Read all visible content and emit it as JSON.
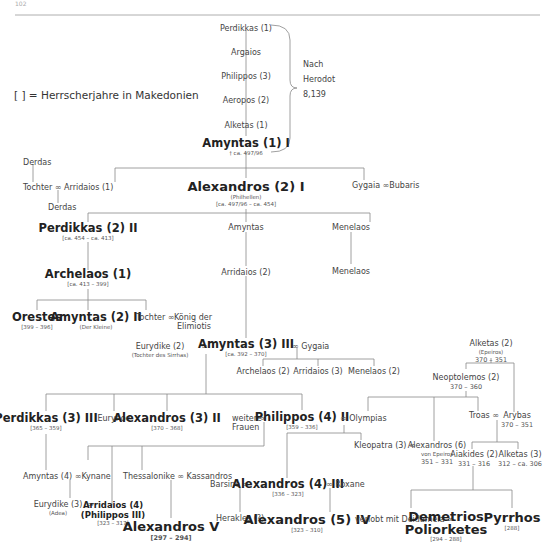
{
  "page_number": "102",
  "legend": "[ ] = Herrscherjahre in Makedonien",
  "marriage_symbol": "∞",
  "herodot": {
    "list": [
      "Perdikkas (1)",
      "Argaios",
      "Philippos (3)",
      "Aeropos (2)",
      "Alketas (1)"
    ],
    "note_lines": [
      "Nach",
      "Herodot",
      "8,139"
    ]
  },
  "nodes": {
    "amyntas1": {
      "name": "Amyntas (1) I",
      "sub": "† ca. 497/96"
    },
    "derdas_top": {
      "name": "Derdas"
    },
    "tochter1": {
      "name": "Tochter"
    },
    "arridaios1": {
      "name": "Arridaios (1)"
    },
    "derdas_bottom": {
      "name": "Derdas"
    },
    "alexandros2": {
      "name": "Alexandros (2) I",
      "note": "(Philhellen)",
      "years": "[ca. 497/96 – ca. 454]"
    },
    "gygaia1": {
      "name": "Gygaia"
    },
    "bubaris": {
      "name": "Bubaris"
    },
    "perdikkas2": {
      "name": "Perdikkas (2) II",
      "years": "[ca. 454 – ca. 413]"
    },
    "amyntas_mid": {
      "name": "Amyntas"
    },
    "menelaos1": {
      "name": "Menelaos"
    },
    "archelaos1": {
      "name": "Archelaos (1)",
      "years": "[ca. 413 – 399]"
    },
    "arridaios2": {
      "name": "Arridaios (2)"
    },
    "menelaos2": {
      "name": "Menelaos"
    },
    "orestes": {
      "name": "Orestes",
      "years": "[399 – 396]"
    },
    "amyntas2": {
      "name": "Amyntas (2) II",
      "note": "(Der Kleine)"
    },
    "tochter2": {
      "name": "Tochter"
    },
    "koenig_elimiotis": {
      "name_lines": [
        "König der",
        "Elimiotis"
      ]
    },
    "eurydike2": {
      "name": "Eurydike (2)",
      "note": "(Tochter des Sirrhas)"
    },
    "amyntas3": {
      "name": "Amyntas (3) III",
      "years": "[ca. 392 – 370]"
    },
    "gygaia2": {
      "name": "Gygaia"
    },
    "archelaos2": {
      "name": "Archelaos (2)"
    },
    "arridaios3": {
      "name": "Arridaios (3)"
    },
    "menelaos3": {
      "name": "Menelaos (2)"
    },
    "alketas2": {
      "name": "Alketas (2)",
      "note": "(Epeiros)",
      "years": "370 – 351"
    },
    "neoptolemos2": {
      "name": "Neoptolemos (2)",
      "years": "370 – 360"
    },
    "perdikkas3": {
      "name": "Perdikkas (3) III",
      "years": "[365 – 359]"
    },
    "eurynoe": {
      "name": "Eurynoe"
    },
    "alexandros3": {
      "name": "Alexandros (3) II",
      "years": "[370 – 368]"
    },
    "weitere_frauen": {
      "name_lines": [
        "weitere",
        "Frauen"
      ]
    },
    "philippos4": {
      "name": "Philippos (4) II",
      "years": "[359 – 336]"
    },
    "olympias": {
      "name": "Olympias"
    },
    "troas": {
      "name": "Troas"
    },
    "arybas": {
      "name": "Arybas",
      "years": "370 – 351"
    },
    "kleopatra3": {
      "name": "Kleopatra (3)"
    },
    "alexandros6": {
      "name": "Alexandros (6)",
      "note": "von Epeiros",
      "years": "351 – 331"
    },
    "aiakides2": {
      "name": "Aiakides (2)",
      "years": "331 – 316"
    },
    "alketas3": {
      "name": "Alketas (3)",
      "years": "312 – ca. 306"
    },
    "amyntas4": {
      "name": "Amyntas (4)"
    },
    "kynane": {
      "name": "Kynane"
    },
    "thessalonike": {
      "name": "Thessalonike"
    },
    "kassandros": {
      "name": "Kassandros"
    },
    "barsine": {
      "name": "Barsine"
    },
    "alexandros4": {
      "name": "Alexandros (4) III",
      "years": "[336 – 323]"
    },
    "roxane": {
      "name": "Roxane"
    },
    "eurydike3": {
      "name": "Eurydike (3)",
      "note": "(Adea)"
    },
    "arridaios4": {
      "name_lines": [
        "Arridaios (4)",
        "(Philippos III)"
      ],
      "years": "[323 – 317]"
    },
    "herakles": {
      "name": "Herakles (?)"
    },
    "alexandros5": {
      "name": "Alexandros (5) IV",
      "years": "[323 – 310]"
    },
    "verlobt": {
      "name": "verlobt mit Deidameia"
    },
    "demetrios": {
      "name_lines": [
        "Demetrios",
        "Poliorketes"
      ],
      "years": "[294 – 288]"
    },
    "pyrrhos": {
      "name": "Pyrrhos",
      "years": "[288]"
    },
    "alexandrosV": {
      "name": "Alexandros V",
      "years": "[297 – 294]"
    }
  }
}
